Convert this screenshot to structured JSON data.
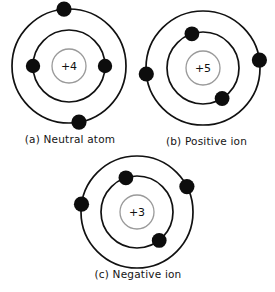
{
  "figure": {
    "background_color": "#ffffff",
    "shell_color": "#111111",
    "electron_color": "#0d0d0d",
    "nucleus_outline_color": "#9a9a9a",
    "label_color": "#141414"
  },
  "diagrams": [
    {
      "id": "neutral-atom",
      "nucleus_charge": "+4",
      "caption": "(a) Neutral atom",
      "center": {
        "x": 69,
        "y": 66
      },
      "shells": [
        {
          "name": "inner-shell",
          "radius": 36
        },
        {
          "name": "outer-shell",
          "radius": 57
        }
      ],
      "electrons": [
        {
          "shell": "inner-shell",
          "angle_deg": 180,
          "radius": 36
        },
        {
          "shell": "inner-shell",
          "angle_deg": 0,
          "radius": 36
        },
        {
          "shell": "outer-shell",
          "angle_deg": 95,
          "radius": 57
        },
        {
          "shell": "outer-shell",
          "angle_deg": -80,
          "radius": 57
        }
      ]
    },
    {
      "id": "positive-ion",
      "nucleus_charge": "+5",
      "caption": "(b) Positive ion",
      "center": {
        "x": 203,
        "y": 68
      },
      "shells": [
        {
          "name": "inner-shell",
          "radius": 36
        },
        {
          "name": "outer-shell",
          "radius": 57
        }
      ],
      "electrons": [
        {
          "shell": "inner-shell",
          "angle_deg": 108,
          "radius": 36
        },
        {
          "shell": "inner-shell",
          "angle_deg": -58,
          "radius": 36
        },
        {
          "shell": "outer-shell",
          "angle_deg": 186,
          "radius": 57
        },
        {
          "shell": "outer-shell",
          "angle_deg": 8,
          "radius": 57
        }
      ]
    },
    {
      "id": "negative-ion",
      "nucleus_charge": "+3",
      "caption": "(c) Negative ion",
      "center": {
        "x": 137,
        "y": 212
      },
      "shells": [
        {
          "name": "inner-shell",
          "radius": 36
        },
        {
          "name": "outer-shell",
          "radius": 56
        }
      ],
      "electrons": [
        {
          "shell": "inner-shell",
          "angle_deg": 108,
          "radius": 36
        },
        {
          "shell": "inner-shell",
          "angle_deg": -52,
          "radius": 36
        },
        {
          "shell": "outer-shell",
          "angle_deg": 172,
          "radius": 56
        },
        {
          "shell": "outer-shell",
          "angle_deg": 27,
          "radius": 56
        }
      ]
    }
  ]
}
